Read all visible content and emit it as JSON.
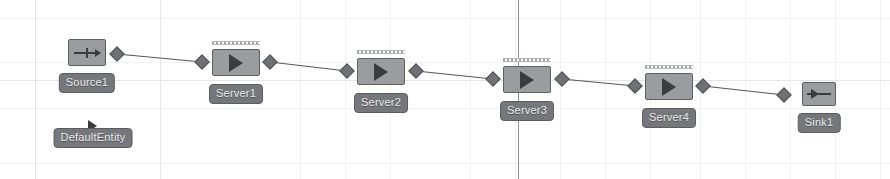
{
  "canvas": {
    "width": 890,
    "height": 179,
    "background": "#ffffff",
    "grid_color": "#f0f1f3",
    "axis_color": "#8d8f92",
    "object_fill": "#9a9ca0",
    "object_border": "#5d5f63",
    "label_fill": "#75777b",
    "label_text_color": "#e9eaec",
    "link_color": "#55575b",
    "node_fill": "#6f7175"
  },
  "grid": {
    "vertical_lines": [
      35,
      160,
      300,
      345,
      390,
      470,
      515,
      560,
      605,
      650,
      700,
      745,
      790,
      835,
      880
    ],
    "horizontal_lines": [
      18,
      62,
      80,
      108,
      163
    ],
    "strong_vertical_lines": [
      35,
      160
    ],
    "strong_horizontal_lines": [
      80
    ],
    "axis_vertical_x": 518
  },
  "objects": [
    {
      "id": "source1",
      "name": "Source1",
      "type": "Source",
      "icon": "source-arrow-icon",
      "box": {
        "x": 68,
        "y": 39,
        "width": 38,
        "height": 27
      },
      "label": {
        "x": 87,
        "y": 73
      }
    },
    {
      "id": "defaultentity",
      "name": "DefaultEntity",
      "type": "ModelEntity",
      "icon": "entity-triangle-icon",
      "box": null,
      "glyph": {
        "x": 93,
        "y": 120
      },
      "label": {
        "x": 93,
        "y": 128
      }
    },
    {
      "id": "server1",
      "name": "Server1",
      "type": "Server",
      "icon": "server-play-icon",
      "box": {
        "x": 212,
        "y": 49,
        "width": 48,
        "height": 27
      },
      "queue": {
        "x": 212,
        "y": 41,
        "width": 48
      },
      "label": {
        "x": 236,
        "y": 84
      }
    },
    {
      "id": "server2",
      "name": "Server2",
      "type": "Server",
      "icon": "server-play-icon",
      "box": {
        "x": 357,
        "y": 58,
        "width": 48,
        "height": 27
      },
      "queue": {
        "x": 357,
        "y": 50,
        "width": 48
      },
      "label": {
        "x": 381,
        "y": 93
      }
    },
    {
      "id": "server3",
      "name": "Server3",
      "type": "Server",
      "icon": "server-play-icon",
      "box": {
        "x": 503,
        "y": 66,
        "width": 48,
        "height": 27
      },
      "queue": {
        "x": 503,
        "y": 58,
        "width": 48
      },
      "label": {
        "x": 527,
        "y": 101
      }
    },
    {
      "id": "server4",
      "name": "Server4",
      "type": "Server",
      "icon": "server-play-icon",
      "box": {
        "x": 645,
        "y": 73,
        "width": 48,
        "height": 27
      },
      "queue": {
        "x": 645,
        "y": 65,
        "width": 48
      },
      "label": {
        "x": 669,
        "y": 108
      }
    },
    {
      "id": "sink1",
      "name": "Sink1",
      "type": "Sink",
      "icon": "sink-arrow-icon",
      "box": {
        "x": 802,
        "y": 82,
        "width": 34,
        "height": 24
      },
      "label": {
        "x": 819,
        "y": 113
      }
    }
  ],
  "nodes": [
    {
      "id": "output-source1",
      "x": 117,
      "y": 54,
      "size": 13
    },
    {
      "id": "input-server1",
      "x": 202,
      "y": 62,
      "size": 13
    },
    {
      "id": "output-server1",
      "x": 270,
      "y": 62,
      "size": 13
    },
    {
      "id": "input-server2",
      "x": 347,
      "y": 71,
      "size": 13
    },
    {
      "id": "output-server2",
      "x": 416,
      "y": 71,
      "size": 13
    },
    {
      "id": "input-server3",
      "x": 493,
      "y": 79,
      "size": 13
    },
    {
      "id": "output-server3",
      "x": 562,
      "y": 79,
      "size": 13
    },
    {
      "id": "input-server4",
      "x": 635,
      "y": 86,
      "size": 13
    },
    {
      "id": "output-server4",
      "x": 703,
      "y": 86,
      "size": 13
    },
    {
      "id": "input-sink1",
      "x": 784,
      "y": 95,
      "size": 13
    }
  ],
  "links": [
    {
      "id": "link-source1-server1",
      "from": "output-source1",
      "to": "input-server1",
      "x1": 117,
      "y1": 54,
      "x2": 202,
      "y2": 62
    },
    {
      "id": "link-server1-server2",
      "from": "output-server1",
      "to": "input-server2",
      "x1": 270,
      "y1": 62,
      "x2": 347,
      "y2": 71
    },
    {
      "id": "link-server2-server3",
      "from": "output-server2",
      "to": "input-server3",
      "x1": 416,
      "y1": 71,
      "x2": 493,
      "y2": 79
    },
    {
      "id": "link-server3-server4",
      "from": "output-server3",
      "to": "input-server4",
      "x1": 562,
      "y1": 79,
      "x2": 635,
      "y2": 86
    },
    {
      "id": "link-server4-sink1",
      "from": "output-server4",
      "to": "input-sink1",
      "x1": 703,
      "y1": 86,
      "x2": 784,
      "y2": 95
    }
  ]
}
